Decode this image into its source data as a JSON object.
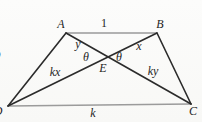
{
  "figure": {
    "colors": {
      "main_line": "#2b2b2b",
      "parallel_line": "#9b9b9b",
      "label": "#1f1f1f",
      "background": "#fbfbf9"
    },
    "points": {
      "A": [
        66,
        33
      ],
      "B": [
        157,
        33
      ],
      "C": [
        191,
        104
      ],
      "D": [
        8,
        106
      ],
      "E": [
        108,
        57
      ]
    },
    "edges": [
      {
        "name": "side-AB",
        "from": "A",
        "to": "B",
        "stroke": "parallel",
        "width": 1.3
      },
      {
        "name": "side-DC",
        "from": "D",
        "to": "C",
        "stroke": "parallel",
        "width": 1.3
      },
      {
        "name": "side-AD",
        "from": "A",
        "to": "D",
        "stroke": "main",
        "width": 1.6
      },
      {
        "name": "side-BC",
        "from": "B",
        "to": "C",
        "stroke": "main",
        "width": 1.6
      },
      {
        "name": "diagonal-AC",
        "from": "A",
        "to": "C",
        "stroke": "main",
        "width": 1.6
      },
      {
        "name": "diagonal-BD",
        "from": "B",
        "to": "D",
        "stroke": "main",
        "width": 1.6
      }
    ],
    "labels": [
      {
        "name": "vertex-label-A",
        "text": "A",
        "x": 61,
        "y": 25,
        "style": "math"
      },
      {
        "name": "length-label-AB",
        "text": "1",
        "x": 104,
        "y": 24,
        "style": "upright"
      },
      {
        "name": "vertex-label-B",
        "text": "B",
        "x": 160,
        "y": 25,
        "style": "math"
      },
      {
        "name": "segment-label-AE",
        "text": "y",
        "x": 78,
        "y": 45,
        "style": "math"
      },
      {
        "name": "segment-label-BE",
        "text": "x",
        "x": 139,
        "y": 47,
        "style": "math"
      },
      {
        "name": "angle-label-theta-left",
        "text": "θ",
        "x": 86,
        "y": 58,
        "style": "math"
      },
      {
        "name": "angle-label-theta-right",
        "text": "θ",
        "x": 119,
        "y": 58,
        "style": "math"
      },
      {
        "name": "point-label-E",
        "text": "E",
        "x": 103,
        "y": 69,
        "style": "math"
      },
      {
        "name": "segment-label-ED",
        "text": "kx",
        "x": 55,
        "y": 73,
        "style": "math"
      },
      {
        "name": "segment-label-EC",
        "text": "ky",
        "x": 153,
        "y": 72,
        "style": "math"
      },
      {
        "name": "length-label-DC",
        "text": "k",
        "x": 93,
        "y": 114,
        "style": "math"
      },
      {
        "name": "vertex-label-D-clipped",
        "text": "D",
        "x": -2,
        "y": 112,
        "style": "math"
      },
      {
        "name": "vertex-label-C",
        "text": "C",
        "x": 193,
        "y": 112,
        "style": "math"
      },
      {
        "name": "clipped-edge-glyph",
        "text": "D",
        "x": -4,
        "y": 56,
        "style": "math"
      }
    ]
  }
}
